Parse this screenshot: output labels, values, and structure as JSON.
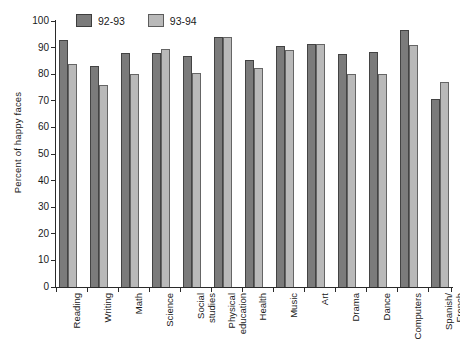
{
  "chart_data": {
    "type": "bar",
    "title": "",
    "xlabel": "",
    "ylabel": "Percent of happy faces",
    "ylim": [
      0,
      100
    ],
    "yticks": [
      0,
      10,
      20,
      30,
      40,
      50,
      60,
      70,
      80,
      90,
      100
    ],
    "grid": false,
    "legend_position": "top-left",
    "categories": [
      "Reading",
      "Writing",
      "Math",
      "Science",
      "Social\nstudies",
      "Physical\neducation",
      "Health",
      "Music",
      "Art",
      "Drama",
      "Dance",
      "Computers",
      "Spanish/\nFrench"
    ],
    "series": [
      {
        "name": "92-93",
        "color": "#7b7b7b",
        "values": [
          93,
          83,
          88,
          88,
          87,
          94,
          85.5,
          90.5,
          91.5,
          87.5,
          88.5,
          96.5,
          70.5
        ]
      },
      {
        "name": "93-94",
        "color": "#b9b9b9",
        "values": [
          84,
          76,
          80,
          89.5,
          80.5,
          94,
          82.5,
          89,
          91.5,
          80,
          80,
          91,
          77
        ]
      }
    ]
  },
  "legend": {
    "entries": [
      {
        "label": "92-93",
        "color": "#7b7b7b"
      },
      {
        "label": "93-94",
        "color": "#b9b9b9"
      }
    ]
  },
  "axes": {
    "y_title": "Percent of happy faces",
    "y_tick_labels": [
      "0",
      "10",
      "20",
      "30",
      "40",
      "50",
      "60",
      "70",
      "80",
      "90",
      "100"
    ]
  }
}
